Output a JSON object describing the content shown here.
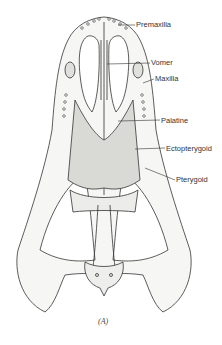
{
  "figure": {
    "caption": "(A)",
    "labels": [
      {
        "text": "Premaxilla",
        "x": 136,
        "y": 21,
        "line": [
          118,
          25,
          135,
          25
        ]
      },
      {
        "text": "Vomer",
        "x": 151,
        "y": 59,
        "line": [
          107,
          64,
          150,
          63
        ]
      },
      {
        "text": "Maxilla",
        "x": 155,
        "y": 75,
        "line": [
          143,
          83,
          154,
          79
        ]
      },
      {
        "text": "Palatine",
        "x": 161,
        "y": 117,
        "line": [
          118,
          121,
          160,
          120
        ]
      },
      {
        "text": "Ectopterygoid",
        "x": 166,
        "y": 145,
        "line": [
          135,
          149,
          165,
          148
        ]
      },
      {
        "text": "Pterygoid",
        "x": 176,
        "y": 176,
        "line": [
          145,
          168,
          175,
          180
        ]
      }
    ]
  }
}
